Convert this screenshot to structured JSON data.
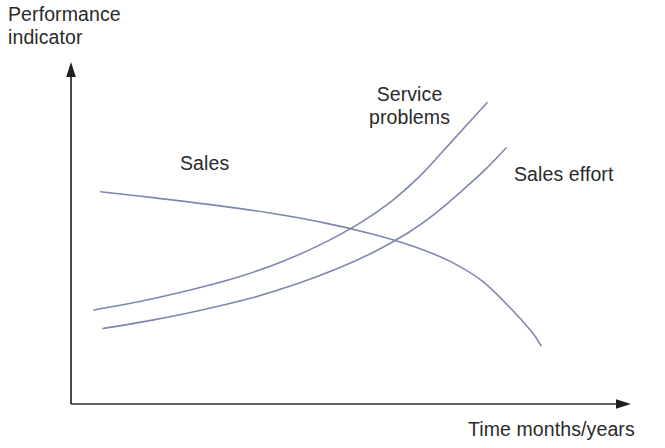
{
  "chart_data": {
    "type": "line",
    "title": "",
    "subtitle": "",
    "xlabel": "Time months/years",
    "ylabel": "Performance indicator",
    "grid": false,
    "legend_position": "inline-labels",
    "axes": {
      "x_axis_arrow": true,
      "y_axis_arrow": true,
      "x_tick_labels": [],
      "y_tick_labels": [],
      "xlim_label": "Time months/years",
      "ylim_label": "Performance indicator"
    },
    "annotations": [
      {
        "text": "Sales",
        "curve": "Sales"
      },
      {
        "text": "Service problems",
        "curve": "Service problems"
      },
      {
        "text": "Sales effort",
        "curve": "Sales effort"
      }
    ],
    "series": [
      {
        "name": "Sales",
        "label": "Sales",
        "color": "#7e88ad",
        "trend": "declining S-curve",
        "points": [
          [
            0.03,
            0.655
          ],
          [
            0.15,
            0.636
          ],
          [
            0.28,
            0.614
          ],
          [
            0.4,
            0.59
          ],
          [
            0.52,
            0.56
          ],
          [
            0.63,
            0.524
          ],
          [
            0.72,
            0.486
          ],
          [
            0.8,
            0.44
          ],
          [
            0.87,
            0.38
          ],
          [
            0.93,
            0.3
          ],
          [
            0.98,
            0.222
          ],
          [
            1.0,
            0.18
          ]
        ]
      },
      {
        "name": "Service problems",
        "label": "Service problems",
        "color": "#7e88ad",
        "trend": "rising convex curve",
        "points": [
          [
            0.02,
            0.29
          ],
          [
            0.14,
            0.318
          ],
          [
            0.26,
            0.352
          ],
          [
            0.38,
            0.392
          ],
          [
            0.49,
            0.44
          ],
          [
            0.59,
            0.495
          ],
          [
            0.68,
            0.556
          ],
          [
            0.76,
            0.624
          ],
          [
            0.83,
            0.7
          ],
          [
            0.89,
            0.78
          ],
          [
            0.95,
            0.862
          ],
          [
            1.0,
            0.93
          ]
        ]
      },
      {
        "name": "Sales effort",
        "label": "Sales effort",
        "color": "#7e88ad",
        "trend": "rising curve, lower start",
        "points": [
          [
            0.02,
            0.233
          ],
          [
            0.14,
            0.259
          ],
          [
            0.26,
            0.29
          ],
          [
            0.38,
            0.327
          ],
          [
            0.49,
            0.37
          ],
          [
            0.59,
            0.418
          ],
          [
            0.68,
            0.47
          ],
          [
            0.76,
            0.527
          ],
          [
            0.83,
            0.59
          ],
          [
            0.89,
            0.655
          ],
          [
            0.95,
            0.724
          ],
          [
            1.0,
            0.79
          ]
        ]
      }
    ]
  },
  "labels": {
    "y_axis_line1": "Performance",
    "y_axis_line2": "indicator",
    "x_axis": "Time months/years",
    "sales": "Sales",
    "service_problems_line1": "Service",
    "service_problems_line2": "problems",
    "sales_effort": "Sales effort"
  },
  "colors": {
    "curve": "#7e88ad",
    "axis": "#2b2b2b",
    "text": "#2a2a2a",
    "background": "#ffffff"
  }
}
